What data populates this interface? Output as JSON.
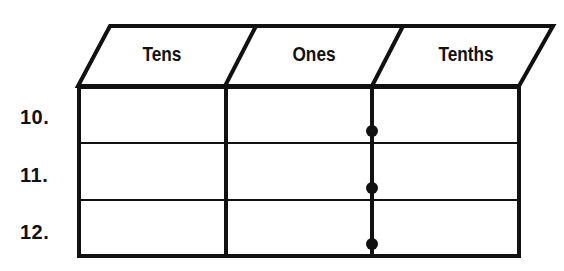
{
  "diagram": {
    "columns": [
      {
        "label": "Tens"
      },
      {
        "label": "Ones"
      },
      {
        "label": "Tenths"
      }
    ],
    "rows": [
      {
        "label": "10.",
        "cells": [
          "",
          "",
          ""
        ]
      },
      {
        "label": "11.",
        "cells": [
          "",
          "",
          ""
        ]
      },
      {
        "label": "12.",
        "cells": [
          "",
          "",
          ""
        ]
      }
    ],
    "decimal_point_marker": "dot on line between Ones and Tenths",
    "colors": {
      "line": "#111111",
      "background": "#ffffff"
    }
  }
}
